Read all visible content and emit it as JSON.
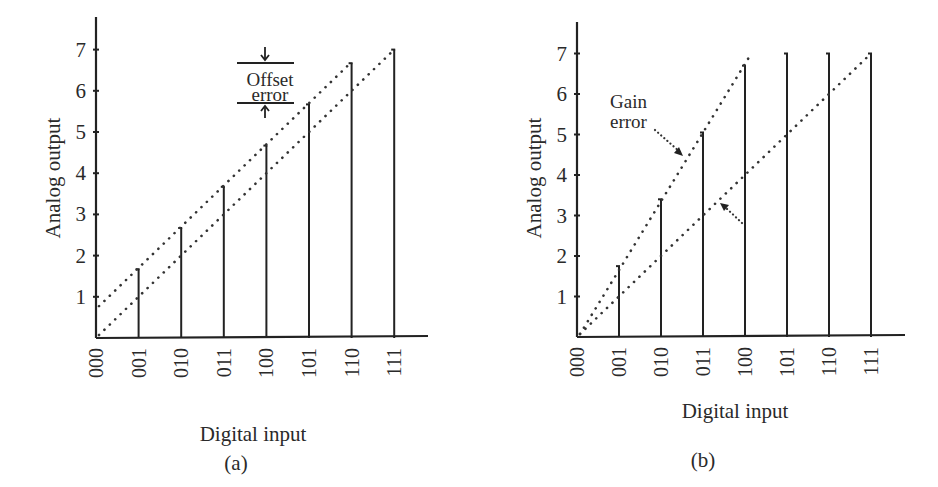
{
  "chart_data": [
    {
      "id": "a",
      "type": "line",
      "title": "Offset error",
      "caption": "(a)",
      "xlabel": "Digital input",
      "ylabel": "Analog output",
      "categories": [
        "000",
        "001",
        "010",
        "011",
        "100",
        "101",
        "110",
        "111"
      ],
      "yticks": [
        1,
        2,
        3,
        4,
        5,
        6,
        7
      ],
      "ylim": [
        0,
        7.8
      ],
      "grid": false,
      "bars": [
        0,
        1.67,
        2.67,
        3.67,
        4.67,
        5.67,
        6.67,
        7
      ],
      "series": [
        {
          "name": "ideal",
          "style": "dotted",
          "x": [
            0,
            7
          ],
          "values": [
            0,
            7
          ]
        },
        {
          "name": "offset",
          "style": "dotted",
          "x": [
            0,
            6
          ],
          "values": [
            0.7,
            6.7
          ]
        }
      ],
      "annotation": {
        "line1": "Offset",
        "line2": "error"
      }
    },
    {
      "id": "b",
      "type": "line",
      "title": "Gain error",
      "caption": "(b)",
      "xlabel": "Digital input",
      "ylabel": "Analog output",
      "categories": [
        "000",
        "001",
        "010",
        "011",
        "100",
        "101",
        "110",
        "111"
      ],
      "yticks": [
        1,
        2,
        3,
        4,
        5,
        6,
        7
      ],
      "ylim": [
        0,
        7.8
      ],
      "grid": false,
      "bars": [
        0,
        1.75,
        3.4,
        5.05,
        6.7,
        7,
        7,
        7
      ],
      "series": [
        {
          "name": "ideal",
          "style": "dotted",
          "x": [
            0,
            7
          ],
          "values": [
            0,
            7
          ]
        },
        {
          "name": "gain",
          "style": "dotted",
          "x": [
            0,
            4.15
          ],
          "values": [
            0,
            7
          ]
        }
      ],
      "annotation": {
        "line1": "Gain",
        "line2": "error"
      }
    }
  ]
}
